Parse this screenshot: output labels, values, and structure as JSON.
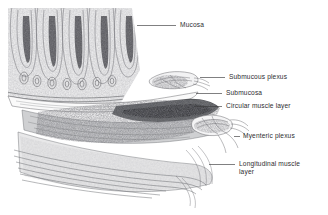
{
  "figure": {
    "background_color": "#ffffff",
    "ink_color": "#55565a",
    "label_color": "#2e2e30"
  },
  "labels": [
    {
      "id": "mucosa",
      "text": "Mucosa",
      "x": 180,
      "y": 22,
      "leader": {
        "x1": 137,
        "y1": 25.5,
        "x2": 176,
        "y2": 25.5
      }
    },
    {
      "id": "submucous-plexus",
      "text": "Submucous plexus",
      "x": 229,
      "y": 74,
      "leader": {
        "x1": 200,
        "y1": 77.5,
        "x2": 225,
        "y2": 77.5
      }
    },
    {
      "id": "submucosa",
      "text": "Submucosa",
      "x": 226,
      "y": 90,
      "leader": {
        "x1": 196,
        "y1": 93.5,
        "x2": 222,
        "y2": 93.5
      }
    },
    {
      "id": "circular-muscle-layer",
      "text": "Circular muscle layer",
      "x": 226,
      "y": 103,
      "leader": {
        "x1": 194,
        "y1": 106.5,
        "x2": 222,
        "y2": 106.5
      }
    },
    {
      "id": "myenteric-plexus",
      "text": "Myenteric plexus",
      "x": 243,
      "y": 133,
      "leader": {
        "x1": 243,
        "y1": 136.5,
        "x2": 239,
        "y2": 136.5
      }
    },
    {
      "id": "longitudinal-muscle-layer",
      "text": "Longitudinal muscle\nlayer",
      "x": 239,
      "y": 161,
      "leader": {
        "x1": 209,
        "y1": 164.5,
        "x2": 235,
        "y2": 164.5
      }
    }
  ],
  "structures": [
    {
      "id": "villi",
      "name": "intestinal villi / mucosal folds"
    },
    {
      "id": "submucosa-band",
      "name": "submucosa connective band"
    },
    {
      "id": "circular-muscle",
      "name": "circular muscle layer band"
    },
    {
      "id": "longitudinal-muscle",
      "name": "longitudinal muscle fibers"
    },
    {
      "id": "submucous-plexus-nerve",
      "name": "submucous nerve plexus"
    },
    {
      "id": "myenteric-plexus-nerve",
      "name": "myenteric nerve plexus"
    }
  ]
}
